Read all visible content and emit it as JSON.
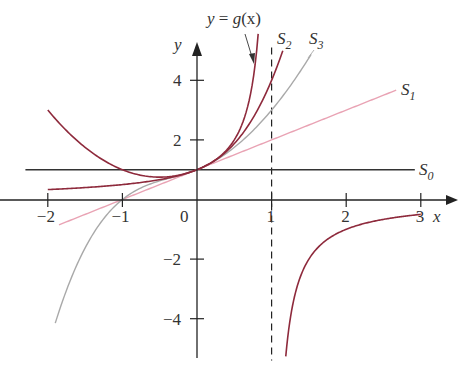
{
  "figure": {
    "x_axis_label": "x",
    "y_axis_label": "y",
    "x_ticks": [
      {
        "value": -2,
        "label": "−2"
      },
      {
        "value": -1,
        "label": "−1"
      },
      {
        "value": 0,
        "label": "0"
      },
      {
        "value": 1,
        "label": "1"
      },
      {
        "value": 2,
        "label": "2"
      },
      {
        "value": 3,
        "label": "3"
      }
    ],
    "y_ticks": [
      {
        "value": 4,
        "label": "4"
      },
      {
        "value": 2,
        "label": "2"
      },
      {
        "value": -2,
        "label": "−2"
      },
      {
        "value": -4,
        "label": "−4"
      }
    ],
    "annotation": {
      "text": "y = g(x)",
      "prefix": "y",
      "eq": " = ",
      "func": "g",
      "arg": "(x)"
    },
    "asymptote": {
      "x": 1,
      "style": "dashed"
    },
    "curve_labels": {
      "S0": {
        "main": "S",
        "sub": "0"
      },
      "S1": {
        "main": "S",
        "sub": "1"
      },
      "S2": {
        "main": "S",
        "sub": "2"
      },
      "S3": {
        "main": "S",
        "sub": "3"
      }
    },
    "colors": {
      "g": "#8e2a3c",
      "S0": "#333333",
      "S1": "#e9a3b4",
      "S2": "#8e2a3c",
      "S3": "#a9a9a9",
      "axis": "#222222"
    }
  },
  "chart_data": {
    "type": "line",
    "title": "",
    "xlabel": "x",
    "ylabel": "y",
    "xlim": [
      -2,
      3
    ],
    "ylim": [
      -5,
      5
    ],
    "series": [
      {
        "name": "y = g(x) = 1/(1-x)",
        "color": "#8e2a3c",
        "branches": [
          [
            -2,
            0.82
          ],
          [
            1.19,
            3
          ]
        ]
      },
      {
        "name": "S0 = 1",
        "color": "#333333",
        "domain": [
          -2.3,
          2.92
        ]
      },
      {
        "name": "S1 = 1 + x",
        "color": "#e9a3b4",
        "domain": [
          -1.85,
          2.67
        ]
      },
      {
        "name": "S2 = 1 + x + x^2",
        "color": "#8e2a3c",
        "domain": [
          -2,
          1.15
        ]
      },
      {
        "name": "S3 = 1 + x + x^2 + x^3",
        "color": "#a9a9a9",
        "domain": [
          -1.9,
          1.53
        ]
      }
    ],
    "vertical_asymptote": 1,
    "grid": false
  }
}
